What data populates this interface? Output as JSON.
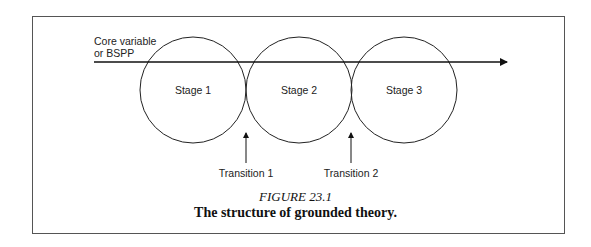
{
  "diagram": {
    "core_label": "Core variable\nor BSPP",
    "stages": [
      {
        "label": "Stage 1"
      },
      {
        "label": "Stage 2"
      },
      {
        "label": "Stage 3"
      }
    ],
    "transitions": [
      {
        "label": "Transition 1"
      },
      {
        "label": "Transition 2"
      }
    ]
  },
  "caption": {
    "number": "FIGURE 23.1",
    "title": "The structure of grounded theory."
  }
}
